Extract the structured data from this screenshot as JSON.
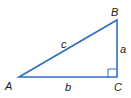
{
  "diagram": {
    "type": "right-triangle",
    "line_color": "#2f6fc0",
    "label_color": "#1a1a1a",
    "vertices": {
      "A": {
        "label": "A",
        "x": 19,
        "y": 77
      },
      "B": {
        "label": "B",
        "x": 117,
        "y": 20
      },
      "C": {
        "label": "C",
        "x": 117,
        "y": 77
      }
    },
    "sides": {
      "a": {
        "label": "a",
        "between": "B-C"
      },
      "b": {
        "label": "b",
        "between": "A-C"
      },
      "c": {
        "label": "c",
        "between": "A-B"
      }
    },
    "right_angle_at": "C"
  }
}
